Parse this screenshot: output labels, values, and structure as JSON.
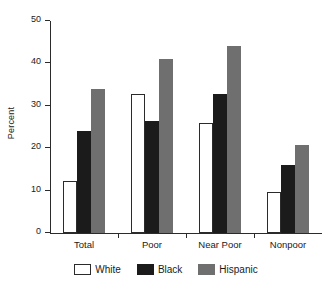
{
  "chart_data": {
    "type": "bar",
    "title": "",
    "subtitle": "",
    "xlabel": "",
    "ylabel": "Percent",
    "categories": [
      "Total",
      "Poor",
      "Near Poor",
      "Nonpoor"
    ],
    "series": [
      {
        "name": "White",
        "color": "#ffffff",
        "values": [
          12.2,
          32.8,
          25.9,
          9.7
        ]
      },
      {
        "name": "Black",
        "color": "#1b1b1b",
        "values": [
          24.1,
          26.4,
          32.9,
          16.0
        ]
      },
      {
        "name": "Hispanic",
        "color": "#6f6f6f",
        "values": [
          33.9,
          41.0,
          44.1,
          20.7
        ]
      }
    ],
    "ylim": [
      0,
      50
    ],
    "yticks": [
      0,
      10,
      20,
      30,
      40,
      50
    ],
    "ytick_labels": [
      "0",
      "10",
      "20",
      "30",
      "40",
      "50"
    ],
    "grid": false,
    "legend_position": "bottom",
    "legend_entries": [
      "White",
      "Black",
      "Hispanic"
    ]
  },
  "axes": {
    "y_label": "Percent"
  }
}
